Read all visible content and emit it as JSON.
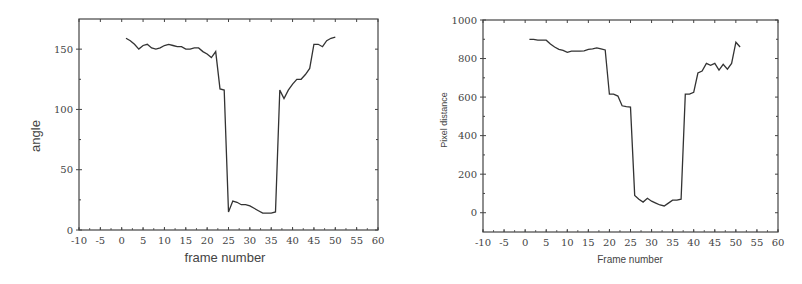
{
  "chart_data": [
    {
      "type": "line",
      "title": "",
      "xlabel": "frame number",
      "ylabel": "angle",
      "xlim": [
        -10,
        60
      ],
      "ylim": [
        0,
        175
      ],
      "xticks": [
        -10,
        -5,
        0,
        5,
        10,
        15,
        20,
        25,
        30,
        35,
        40,
        45,
        50,
        55,
        60
      ],
      "yticks": [
        0,
        50,
        100,
        150
      ],
      "grid": false,
      "legend": null,
      "series": [
        {
          "name": "angle",
          "x": [
            1,
            2,
            3,
            4,
            5,
            6,
            7,
            8,
            9,
            10,
            11,
            12,
            13,
            14,
            15,
            16,
            17,
            18,
            19,
            20,
            21,
            22,
            23,
            24,
            25,
            26,
            27,
            28,
            29,
            30,
            31,
            32,
            33,
            34,
            35,
            36,
            37,
            38,
            39,
            40,
            41,
            42,
            43,
            44,
            45,
            46,
            47,
            48,
            49,
            50
          ],
          "values": [
            159,
            157,
            154,
            150,
            153,
            154,
            151,
            150,
            151,
            153,
            154,
            153,
            152,
            152,
            150,
            150,
            151,
            151,
            148,
            146,
            143,
            148,
            117,
            116,
            15,
            24,
            23,
            21,
            21,
            20,
            18,
            16,
            14,
            14,
            14,
            15,
            116,
            109,
            116,
            121,
            125,
            125,
            129,
            134,
            154,
            154,
            152,
            157,
            159,
            160
          ]
        }
      ]
    },
    {
      "type": "line",
      "title": "",
      "xlabel": "Frame number",
      "ylabel": "Pixel distance",
      "xlim": [
        -10,
        60
      ],
      "ylim": [
        -100,
        1000
      ],
      "xticks": [
        -10,
        -5,
        0,
        5,
        10,
        15,
        20,
        25,
        30,
        35,
        40,
        45,
        50,
        55,
        60
      ],
      "yticks": [
        0,
        200,
        400,
        600,
        800,
        1000
      ],
      "grid": false,
      "legend": null,
      "series": [
        {
          "name": "pixel distance",
          "x": [
            1,
            2,
            3,
            4,
            5,
            6,
            7,
            8,
            9,
            10,
            11,
            12,
            13,
            14,
            15,
            16,
            17,
            18,
            19,
            20,
            21,
            22,
            23,
            24,
            25,
            26,
            27,
            28,
            29,
            30,
            31,
            32,
            33,
            34,
            35,
            36,
            37,
            38,
            39,
            40,
            41,
            42,
            43,
            44,
            45,
            46,
            47,
            48,
            49,
            50,
            51
          ],
          "values": [
            900,
            900,
            895,
            895,
            895,
            875,
            860,
            848,
            843,
            832,
            838,
            838,
            838,
            840,
            848,
            850,
            855,
            850,
            845,
            615,
            615,
            605,
            555,
            550,
            548,
            90,
            70,
            55,
            75,
            60,
            50,
            40,
            35,
            50,
            65,
            65,
            70,
            615,
            615,
            625,
            725,
            735,
            775,
            765,
            775,
            740,
            770,
            745,
            775,
            885,
            860
          ]
        }
      ]
    }
  ],
  "charts": [
    {
      "xlabel": "frame number",
      "ylabel": "angle",
      "xtick_labels": [
        "-10",
        "-5",
        "0",
        "5",
        "10",
        "15",
        "20",
        "25",
        "30",
        "35",
        "40",
        "45",
        "50",
        "55",
        "60"
      ],
      "ytick_labels": [
        "0",
        "50",
        "100",
        "150"
      ]
    },
    {
      "xlabel": "Frame number",
      "ylabel": "Pixel distance",
      "xtick_labels": [
        "-10",
        "-5",
        "0",
        "5",
        "10",
        "15",
        "20",
        "25",
        "30",
        "35",
        "40",
        "45",
        "50",
        "55",
        "60"
      ],
      "ytick_labels": [
        "0",
        "200",
        "400",
        "600",
        "800",
        "1000"
      ]
    }
  ],
  "colors": {
    "line": "#333333",
    "axis": "#444444",
    "background": "#ffffff"
  }
}
